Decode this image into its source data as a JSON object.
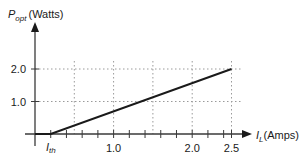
{
  "chart_data": {
    "type": "line",
    "title": "",
    "xlabel": {
      "main": "I",
      "sub": "L",
      "unit": "(Amps)"
    },
    "ylabel": {
      "main": "P",
      "sub": "opt",
      "unit": "(Watts)"
    },
    "threshold_label": {
      "main": "I",
      "sub": "th"
    },
    "xlim": [
      0,
      2.5
    ],
    "ylim": [
      0,
      2.0
    ],
    "x_tick_labels": [
      "1.0",
      "2.0",
      "2.5"
    ],
    "x_tick_values": [
      1.0,
      2.0,
      2.5
    ],
    "x_minor_tick_step": 0.2,
    "y_tick_labels": [
      "1.0",
      "2.0"
    ],
    "y_tick_values": [
      1.0,
      2.0
    ],
    "grid": {
      "style": "dotted",
      "x_lines": [
        0.5,
        1.0,
        1.5,
        2.0,
        2.5
      ],
      "y_lines": [
        1.0,
        2.0
      ]
    },
    "legend": null,
    "series": [
      {
        "name": "P_opt vs I_L",
        "x": [
          0,
          0.2,
          2.5
        ],
        "y": [
          0,
          0,
          2.0
        ]
      }
    ],
    "threshold_current": 0.2
  }
}
